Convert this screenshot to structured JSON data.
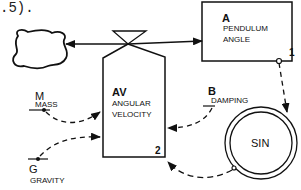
{
  "caption_fragment": ".5).",
  "nodes": {
    "cloud": {
      "label": ""
    },
    "pendulum_angle": {
      "letter": "A",
      "line1": "PENDULUM",
      "line2": "ANGLE",
      "index": "1"
    },
    "angular_velocity": {
      "letter": "AV",
      "line1": "ANGULAR",
      "line2": "VELOCITY",
      "index": "2"
    },
    "sin": {
      "label": "SIN"
    },
    "mass": {
      "letter": "M",
      "name": "MASS"
    },
    "damping": {
      "letter": "B",
      "name": "DAMPING"
    },
    "gravity": {
      "letter": "G",
      "name": "GRAVITY"
    }
  },
  "edges": [
    {
      "from": "angular_velocity",
      "to": "cloud",
      "style": "solid-flow"
    },
    {
      "from": "angular_velocity",
      "to": "pendulum_angle",
      "style": "solid-flow"
    },
    {
      "from": "pendulum_angle",
      "to": "sin",
      "style": "dashed"
    },
    {
      "from": "sin",
      "to": "angular_velocity",
      "style": "dashed"
    },
    {
      "from": "damping",
      "to": "angular_velocity",
      "style": "dashed"
    },
    {
      "from": "mass",
      "to": "angular_velocity",
      "style": "dashed"
    },
    {
      "from": "gravity",
      "to": "angular_velocity",
      "style": "dashed"
    }
  ],
  "colors": {
    "ink": "#111111",
    "background": "#ffffff"
  }
}
